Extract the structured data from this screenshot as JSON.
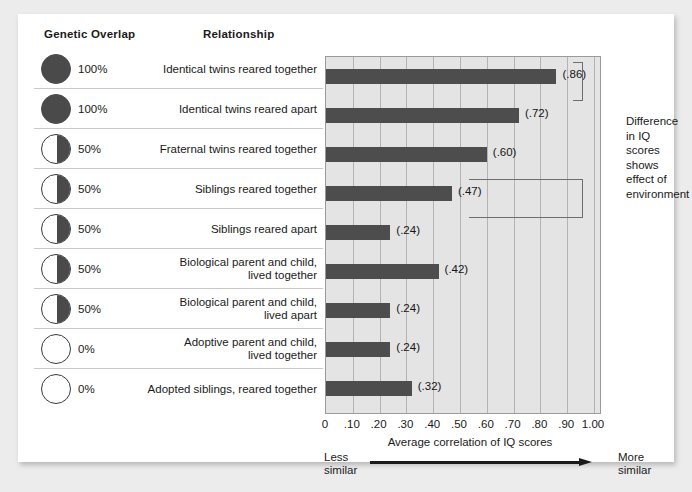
{
  "headers": {
    "genetic_overlap": "Genetic Overlap",
    "relationship": "Relationship"
  },
  "annotation": {
    "text": "Difference\nin IQ\nscores\nshows\neffect of\nenvironment"
  },
  "axis": {
    "title": "Average correlation of IQ scores",
    "left_label": "Less\nsimilar",
    "right_label": "More\nsimilar",
    "ticks": [
      "0",
      ".10",
      ".20",
      ".30",
      ".40",
      ".50",
      ".60",
      ".70",
      ".80",
      ".90",
      "1.00"
    ]
  },
  "rows": [
    {
      "genetic_overlap": "100%",
      "overlap_value": 100,
      "circle": "full-circle-icon",
      "relationship": "Identical twins reared together",
      "value_label": "(.86)",
      "value": 0.86
    },
    {
      "genetic_overlap": "100%",
      "overlap_value": 100,
      "circle": "full-circle-icon",
      "relationship": "Identical twins reared apart",
      "value_label": "(.72)",
      "value": 0.72
    },
    {
      "genetic_overlap": "50%",
      "overlap_value": 50,
      "circle": "half-circle-icon",
      "relationship": "Fraternal twins reared together",
      "value_label": "(.60)",
      "value": 0.6
    },
    {
      "genetic_overlap": "50%",
      "overlap_value": 50,
      "circle": "half-circle-icon",
      "relationship": "Siblings reared together",
      "value_label": "(.47)",
      "value": 0.47
    },
    {
      "genetic_overlap": "50%",
      "overlap_value": 50,
      "circle": "half-circle-icon",
      "relationship": "Siblings reared apart",
      "value_label": "(.24)",
      "value": 0.24
    },
    {
      "genetic_overlap": "50%",
      "overlap_value": 50,
      "circle": "half-circle-icon",
      "relationship": "Biological parent and child,\nlived together",
      "value_label": "(.42)",
      "value": 0.42
    },
    {
      "genetic_overlap": "50%",
      "overlap_value": 50,
      "circle": "half-circle-icon",
      "relationship": "Biological parent and child,\nlived apart",
      "value_label": "(.24)",
      "value": 0.24
    },
    {
      "genetic_overlap": "0%",
      "overlap_value": 0,
      "circle": "empty-circle-icon",
      "relationship": "Adoptive parent and child,\nlived together",
      "value_label": "(.24)",
      "value": 0.24
    },
    {
      "genetic_overlap": "0%",
      "overlap_value": 0,
      "circle": "empty-circle-icon",
      "relationship": "Adopted siblings, reared together",
      "value_label": "(.32)",
      "value": 0.32
    }
  ],
  "brackets": [
    {
      "name": "bracket-identical-twins",
      "rows": [
        0,
        1
      ]
    },
    {
      "name": "bracket-siblings",
      "rows": [
        3,
        4
      ]
    }
  ],
  "colors": {
    "bar": "#4d4d4d",
    "plot_background": "#e4e4e4",
    "gridline": "#b3b3b5",
    "card": "#ffffff",
    "page": "#ececec",
    "text": "#1a1a1a"
  },
  "chart_data": {
    "type": "bar",
    "title": "",
    "orientation": "horizontal",
    "categories": [
      "Identical twins reared together",
      "Identical twins reared apart",
      "Fraternal twins reared together",
      "Siblings reared together",
      "Siblings reared apart",
      "Biological parent and child, lived together",
      "Biological parent and child, lived apart",
      "Adoptive parent and child, lived together",
      "Adopted siblings, reared together"
    ],
    "values": [
      0.86,
      0.72,
      0.6,
      0.47,
      0.24,
      0.42,
      0.24,
      0.24,
      0.32
    ],
    "genetic_overlap_percent": [
      100,
      100,
      50,
      50,
      50,
      50,
      50,
      0,
      0
    ],
    "xlabel": "Average correlation of IQ scores",
    "ylabel": "",
    "xlim": [
      0,
      1.0
    ],
    "xticks": [
      0,
      0.1,
      0.2,
      0.3,
      0.4,
      0.5,
      0.6,
      0.7,
      0.8,
      0.9,
      1.0
    ],
    "xticklabels": [
      "0",
      ".10",
      ".20",
      ".30",
      ".40",
      ".50",
      ".60",
      ".70",
      ".80",
      ".90",
      "1.00"
    ],
    "grid": "vertical",
    "legend": "none",
    "annotations": [
      "Difference in IQ scores shows effect of environment",
      "Less similar",
      "More similar"
    ]
  }
}
